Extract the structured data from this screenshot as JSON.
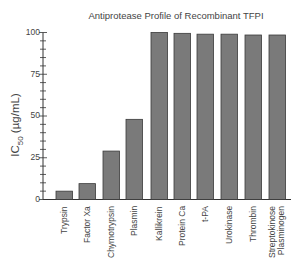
{
  "chart_data": {
    "type": "bar",
    "title": "Antiprotease Profile of Recombinant TFPI",
    "xlabel": "",
    "ylabel": "IC50 (µg/mL)",
    "ylabel_main": "IC",
    "ylabel_sub": "50",
    "ylabel_unit": " (µg/mL)",
    "ylim": [
      0,
      100
    ],
    "yticks": [
      0,
      25,
      50,
      75,
      100
    ],
    "minor_tick_step": 5,
    "grid": false,
    "categories": [
      "Trypsin",
      "Factor Xa",
      "Chymotrypsin",
      "Plasmin",
      "Kallikrein",
      "Protein Ca",
      "t-PA",
      "Urokinase",
      "Thrombin",
      "Streptokinose Plasminogen"
    ],
    "values": [
      5,
      9.5,
      29,
      48,
      100,
      99.5,
      99,
      99,
      98.5,
      98.5
    ],
    "bar_color": "#7a7a7a",
    "bar_edge_color": "#3a3a3a"
  },
  "labels": {
    "tick_0": "0",
    "tick_25": "25",
    "tick_50": "50",
    "tick_75": "75",
    "tick_100": "100"
  }
}
